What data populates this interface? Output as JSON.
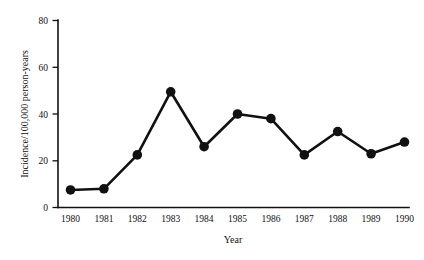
{
  "chart_data": {
    "type": "line",
    "title": "",
    "subtitle": "",
    "xlabel": "Year",
    "ylabel": "Incidence/100,000 person-years",
    "categories": [
      "1980",
      "1981",
      "1982",
      "1983",
      "1984",
      "1985",
      "1986",
      "1987",
      "1988",
      "1989",
      "1990"
    ],
    "values": [
      7.5,
      8,
      22.5,
      49.5,
      26,
      40,
      38,
      22.5,
      32.5,
      23,
      28
    ],
    "series": [
      {
        "name": "Incidence",
        "values": [
          7.5,
          8,
          22.5,
          49.5,
          26,
          40,
          38,
          22.5,
          32.5,
          23,
          28
        ]
      }
    ],
    "ylim": [
      0,
      80
    ],
    "yticks": [
      0,
      20,
      40,
      60,
      80
    ],
    "ytick_labels": [
      "0",
      "20",
      "40",
      "60",
      "80"
    ],
    "xtick_labels": [
      "1980",
      "1981",
      "1982",
      "1983",
      "1984",
      "1985",
      "1986",
      "1987",
      "1988",
      "1989",
      "1990"
    ],
    "grid": false,
    "legend": false,
    "legend_position": "none",
    "annotations": [],
    "marker": "filled-circle",
    "line_color": "#111111",
    "marker_color": "#111111",
    "background_color": "#ffffff"
  },
  "axes": {
    "y_title": "Incidence/100,000 person-years",
    "x_title": "Year"
  }
}
